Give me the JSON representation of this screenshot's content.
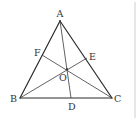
{
  "diagram": {
    "type": "triangle-cevians",
    "colors": {
      "line": "#2b2b2b",
      "label": "#333333",
      "background": "#ffffff",
      "border": "#cfcfcf"
    },
    "points": {
      "A": {
        "x": 60,
        "y": 21,
        "label": "A"
      },
      "B": {
        "x": 20,
        "y": 98,
        "label": "B"
      },
      "C": {
        "x": 112,
        "y": 98,
        "label": "C"
      },
      "D": {
        "x": 71,
        "y": 98,
        "label": "D"
      },
      "E": {
        "x": 87,
        "y": 58,
        "label": "E"
      },
      "F": {
        "x": 42,
        "y": 55,
        "label": "F"
      },
      "O": {
        "x": 67,
        "y": 69,
        "label": "O"
      }
    },
    "segments": [
      "AB",
      "BC",
      "CA",
      "AD",
      "BE",
      "CF"
    ]
  }
}
